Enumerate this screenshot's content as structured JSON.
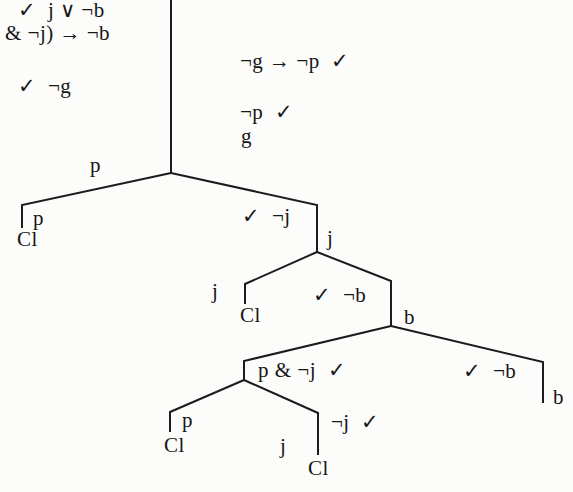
{
  "tableau": {
    "stem_left": {
      "line1": "✓  j ∨ ¬b",
      "line2": "& ¬j) → ¬b",
      "line3": "✓  ¬g"
    },
    "stem_right": {
      "line1": "¬g → ¬p  ✓",
      "line2": "¬p  ✓",
      "line3": "g"
    },
    "fork1": {
      "left_edge_label": "p",
      "left_leaf_formula": "p",
      "left_closure": "Cl",
      "right_formula": "✓  ¬j",
      "right_node_label": "j"
    },
    "fork2": {
      "left_edge_label": "j",
      "left_closure": "Cl",
      "right_formula": "✓  ¬b",
      "right_node_label": "b"
    },
    "fork3": {
      "left_formula": "p & ¬j  ✓",
      "right_formula": "✓  ¬b",
      "right_leaf_label": "b"
    },
    "fork4": {
      "left_leaf_formula": "p",
      "left_closure": "Cl",
      "right_formula": "¬j  ✓",
      "right_edge_label": "j",
      "right_closure": "Cl"
    }
  }
}
